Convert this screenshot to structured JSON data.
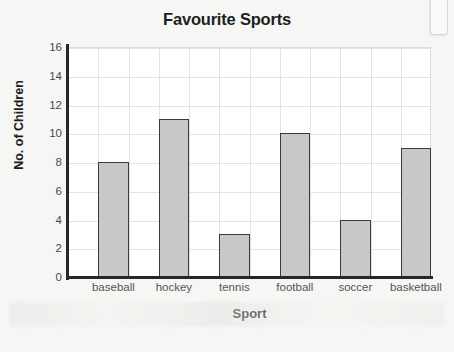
{
  "chart_data": {
    "type": "bar",
    "title": "Favourite Sports",
    "xlabel": "Sport",
    "ylabel": "No. of Children",
    "categories": [
      "baseball",
      "hockey",
      "tennis",
      "football",
      "soccer",
      "basketball"
    ],
    "values": [
      8,
      11,
      3,
      10,
      4,
      9
    ],
    "ylim": [
      0,
      16
    ],
    "ytick_step": 2,
    "ytick_labels": [
      "0",
      "2",
      "4",
      "6",
      "8",
      "10",
      "12",
      "14",
      "16"
    ],
    "grid": true,
    "grid_columns": 12,
    "legend": null,
    "legend_position": "none",
    "colors": {
      "bar_fill": "#c8c8c8",
      "bar_border": "#3a3a3a",
      "gridline": "#e2e2e2",
      "axis_line": "#262626",
      "plot_background": "#ffffff",
      "page_background": "#f6f6f4",
      "title_text": "#201f1f",
      "tick_text": "#55554f"
    }
  }
}
